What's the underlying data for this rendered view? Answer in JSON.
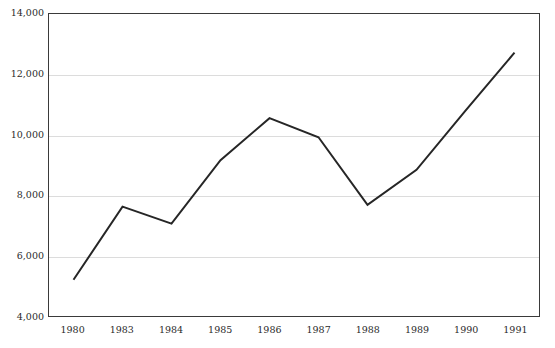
{
  "chart_data": {
    "type": "line",
    "title": "",
    "subtitle": "",
    "xlabel": "",
    "ylabel": "",
    "categories": [
      "1980",
      "1983",
      "1984",
      "1985",
      "1986",
      "1987",
      "1988",
      "1989",
      "1990",
      "1991"
    ],
    "series": [
      {
        "name": "",
        "values": [
          5200,
          7620,
          7060,
          9160,
          10550,
          9920,
          7680,
          8840,
          10800,
          12720
        ],
        "color": "#262626",
        "line_width": 2,
        "markers": false
      }
    ],
    "ylim": [
      4000,
      14000
    ],
    "ytick_labels": [
      "14,000",
      "12,000",
      "10,000",
      "8,000",
      "6,000",
      "4,000"
    ],
    "ytick_values": [
      14000,
      12000,
      10000,
      8000,
      6000,
      4000
    ],
    "ytick_step": 2000,
    "xtick_labels": [
      "1980",
      "1983",
      "1984",
      "1985",
      "1986",
      "1987",
      "1988",
      "1989",
      "1990",
      "1991"
    ],
    "grid": true,
    "grid_axis": "y",
    "grid_color": "#dcdcdc",
    "legend": false,
    "legend_position": "none",
    "frame_color": "#3a3a3a",
    "background_color": "#ffffff",
    "annotations": []
  },
  "figure": {
    "title_clipped": true,
    "title_note": "Chart heading is cut off by the top edge of the screenshot"
  }
}
